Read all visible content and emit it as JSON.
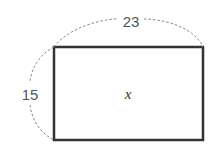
{
  "diagram": {
    "shape": "rectangle",
    "width_label": "23",
    "height_label": "15",
    "area_label": "x",
    "colors": {
      "outline": "#333333",
      "dimension_arc": "#888888",
      "label": "#555555"
    }
  }
}
